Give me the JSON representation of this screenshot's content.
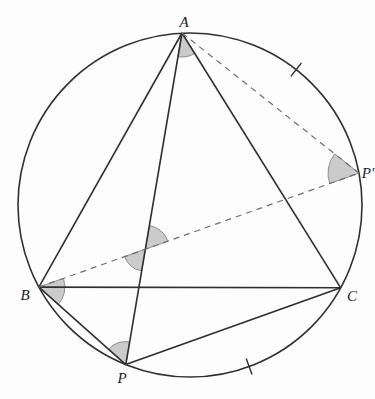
{
  "figure": {
    "background": "#fdfdfd",
    "line_color": "#2f2f2f",
    "dash_color": "#6e6e6e",
    "marker_fill": "#cbcbcb",
    "marker_stroke": "#8f8f8f",
    "label_color": "#1c1c1c",
    "circle": {
      "cx": 190,
      "cy": 205,
      "r": 172
    },
    "points": {
      "A": {
        "x": 182.0,
        "y": 33.0
      },
      "B": {
        "x": 38.9,
        "y": 287.1
      },
      "C": {
        "x": 340.7,
        "y": 287.8
      },
      "P": {
        "x": 125.8,
        "y": 364.6
      },
      "Pp": {
        "x": 359.0,
        "y": 173.1
      },
      "X": {
        "x": 145.4,
        "y": 249.2
      }
    },
    "labels": [
      {
        "key": "A",
        "text": "A",
        "x": 184,
        "y": 27,
        "name": "point-label-a"
      },
      {
        "key": "B",
        "text": "B",
        "x": 25,
        "y": 300,
        "name": "point-label-b"
      },
      {
        "key": "C",
        "text": "C",
        "x": 352,
        "y": 301,
        "name": "point-label-c"
      },
      {
        "key": "P",
        "text": "P",
        "x": 122,
        "y": 383,
        "name": "point-label-p"
      },
      {
        "key": "Pp",
        "text": "P′",
        "x": 368,
        "y": 178,
        "name": "point-label-p-prime"
      }
    ],
    "solid_segments": [
      {
        "from": "A",
        "to": "B",
        "name": "segment-ab"
      },
      {
        "from": "A",
        "to": "C",
        "name": "segment-ac"
      },
      {
        "from": "B",
        "to": "C",
        "name": "segment-bc"
      },
      {
        "from": "P",
        "to": "A",
        "name": "segment-pa"
      },
      {
        "from": "P",
        "to": "B",
        "name": "segment-pb"
      },
      {
        "from": "P",
        "to": "C",
        "name": "segment-pc"
      }
    ],
    "dashed_segments": [
      {
        "from": "A",
        "to": "Pp",
        "name": "dashed-segment-a-pprime"
      },
      {
        "from": "B",
        "to": "Pp",
        "name": "dashed-segment-b-pprime"
      }
    ],
    "angle_markers": [
      {
        "at": "A",
        "from_deg": 58.0,
        "to_deg": 99.6,
        "radius": 24,
        "name": "angle-marker-at-a"
      },
      {
        "at": "Pp",
        "from_deg": 160.4,
        "to_deg": 218.3,
        "radius": 31,
        "name": "angle-marker-at-p-prime"
      },
      {
        "at": "X",
        "from_deg": 279.6,
        "to_deg": 340.4,
        "radius": 24,
        "name": "angle-marker-intersection-upper"
      },
      {
        "at": "X",
        "from_deg": 99.6,
        "to_deg": 160.4,
        "radius": 22,
        "name": "angle-marker-intersection-lower"
      },
      {
        "at": "B",
        "from_deg": -19.6,
        "to_deg": 41.7,
        "radius": 26,
        "name": "angle-marker-at-b"
      },
      {
        "at": "P",
        "from_deg": 221.7,
        "to_deg": 279.6,
        "radius": 23,
        "name": "angle-marker-at-p"
      }
    ],
    "arc_ticks": [
      {
        "angle_deg": -51.9,
        "length": 17,
        "name": "arc-tick-upper"
      },
      {
        "angle_deg": 69.9,
        "length": 17,
        "name": "arc-tick-lower"
      }
    ],
    "stroke_width": 1.6,
    "dash_width": 1.2,
    "dash_pattern": "6 5"
  }
}
